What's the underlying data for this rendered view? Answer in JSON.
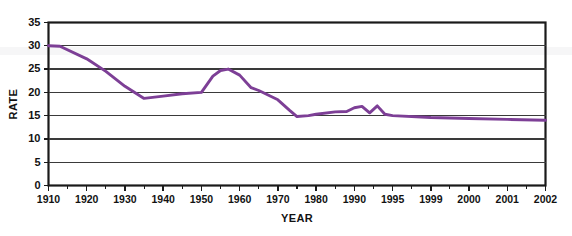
{
  "chart_data": {
    "type": "line",
    "title": "",
    "xlabel": "YEAR",
    "ylabel": "RATE",
    "ylim": [
      0,
      35
    ],
    "yticks": [
      0,
      5,
      10,
      15,
      20,
      25,
      30,
      35
    ],
    "grid": true,
    "legend": false,
    "legend_position": "none",
    "line_color": "#7d3f96",
    "categories": [
      "1910",
      "1920",
      "1930",
      "1940",
      "1950",
      "1960",
      "1970",
      "1980",
      "1990",
      "1995",
      "1999",
      "2000",
      "2001",
      "2002"
    ],
    "minor_ticks_between_labels": 1,
    "series": [
      {
        "name": "Rate",
        "x": [
          1910,
          1913,
          1920,
          1925,
          1930,
          1935,
          1940,
          1945,
          1950,
          1953,
          1955,
          1957,
          1960,
          1963,
          1965,
          1970,
          1973,
          1975,
          1978,
          1980,
          1985,
          1988,
          1990,
          1991,
          1992,
          1993,
          1994,
          1995,
          1999,
          2000,
          2001,
          2002
        ],
        "values": [
          30.0,
          29.9,
          27.2,
          24.5,
          21.3,
          18.7,
          19.2,
          19.7,
          20.0,
          23.5,
          24.7,
          25.0,
          23.7,
          21.0,
          20.4,
          18.4,
          16.2,
          14.8,
          15.0,
          15.3,
          15.8,
          15.9,
          16.7,
          17.0,
          15.6,
          17.1,
          15.3,
          15.0,
          14.6,
          14.4,
          14.2,
          14.0
        ]
      }
    ],
    "annotations": []
  }
}
